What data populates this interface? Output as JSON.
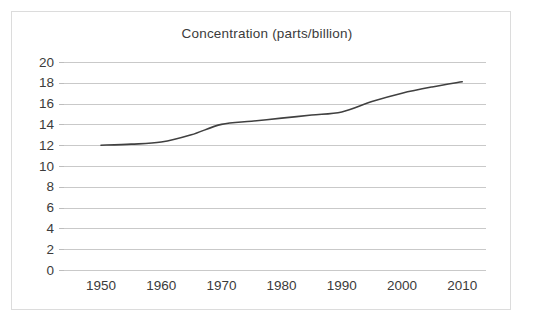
{
  "chart_data": {
    "type": "line",
    "title": "Concentration (parts/billion)",
    "xlabel": "",
    "ylabel": "",
    "xlim": [
      1945,
      2015
    ],
    "ylim": [
      0,
      20
    ],
    "grid": true,
    "legend": "none",
    "line_color": "#404040",
    "grid_color": "#c9c9c9",
    "text_color": "#3b3b3b",
    "border_color": "#dcdcdc",
    "background_color": "#ffffff",
    "x_ticks": [
      1950,
      1960,
      1970,
      1980,
      1990,
      2000,
      2010
    ],
    "x_tick_labels": [
      "1950",
      "1960",
      "1970",
      "1980",
      "1990",
      "2000",
      "2010"
    ],
    "y_ticks": [
      0,
      2,
      4,
      6,
      8,
      10,
      12,
      14,
      16,
      18,
      20
    ],
    "y_tick_labels": [
      "0",
      "2",
      "4",
      "6",
      "8",
      "10",
      "12",
      "14",
      "16",
      "18",
      "20"
    ],
    "series": [
      {
        "name": "Concentration",
        "x": [
          1950,
          1955,
          1960,
          1965,
          1970,
          1975,
          1980,
          1985,
          1990,
          1995,
          2000,
          2005,
          2010
        ],
        "values": [
          12.0,
          12.1,
          12.3,
          13.0,
          14.0,
          14.3,
          14.6,
          14.9,
          15.2,
          16.2,
          17.0,
          17.6,
          18.1
        ]
      }
    ]
  }
}
